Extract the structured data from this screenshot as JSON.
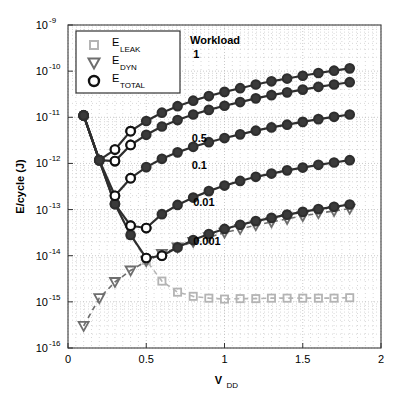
{
  "chart_data": {
    "type": "line",
    "title": "",
    "xlabel": "V_DD",
    "xlabel_base": "V",
    "xlabel_sub": "DD",
    "ylabel": "E/cycle (J)",
    "xlim": [
      0,
      2
    ],
    "ylim_exp": [
      -16,
      -9
    ],
    "xticks": [
      0,
      0.5,
      1,
      1.5,
      2
    ],
    "xticklabels": [
      "0",
      "0.5",
      "1",
      "1.5",
      "2"
    ],
    "yticks_exp": [
      -9,
      -10,
      -11,
      -12,
      -13,
      -14,
      -15,
      -16
    ],
    "yticklabels": [
      "10",
      "10",
      "10",
      "10",
      "10",
      "10",
      "10",
      "10"
    ],
    "ytick_exponents": [
      "-9",
      "-10",
      "-11",
      "-12",
      "-13",
      "-14",
      "-15",
      "-16"
    ],
    "grid": "minor-dotted-both-axes",
    "legend_position": "top-left-inside",
    "legend": [
      {
        "label": "E",
        "sub": "LEAK",
        "marker": "square",
        "color": "#b4b4b4"
      },
      {
        "label": "E",
        "sub": "DYN",
        "marker": "triangle-down",
        "color": "#6e6e6e"
      },
      {
        "label": "E",
        "sub": "TOTAL",
        "marker": "circle",
        "color": "#111111"
      }
    ],
    "annotations": [
      {
        "text": "Workload",
        "x": 0.78,
        "y_exp": -9.42
      },
      {
        "text": "1",
        "x": 0.8,
        "y_exp": -9.72
      },
      {
        "text": "0.5",
        "x": 0.79,
        "y_exp": -11.53
      },
      {
        "text": "0.1",
        "x": 0.79,
        "y_exp": -12.12
      },
      {
        "text": "0.01",
        "x": 0.8,
        "y_exp": -12.93
      },
      {
        "text": "0.001",
        "x": 0.8,
        "y_exp": -13.76
      }
    ],
    "x": [
      0.1,
      0.2,
      0.3,
      0.4,
      0.5,
      0.6,
      0.7,
      0.8,
      0.9,
      1.0,
      1.1,
      1.2,
      1.3,
      1.4,
      1.5,
      1.6,
      1.7,
      1.8
    ],
    "series": [
      {
        "name": "E_LEAK",
        "marker": "square",
        "color": "#b4b4b4",
        "linestyle": "dashed",
        "log_values": [
          -10.96,
          -11.93,
          -12.88,
          -13.55,
          -14.1,
          -14.55,
          -14.79,
          -14.88,
          -14.92,
          -14.94,
          -14.93,
          -14.93,
          -14.92,
          -14.92,
          -14.92,
          -14.92,
          -14.92,
          -14.91
        ]
      },
      {
        "name": "E_DYN",
        "marker": "triangle-down",
        "color": "#6e6e6e",
        "linestyle": "dashed",
        "log_values": [
          -15.52,
          -14.92,
          -14.57,
          -14.32,
          -14.12,
          -13.96,
          -13.82,
          -13.7,
          -13.6,
          -13.5,
          -13.42,
          -13.34,
          -13.27,
          -13.2,
          -13.14,
          -13.08,
          -13.03,
          -12.98
        ]
      },
      {
        "name": "E_TOTAL_w1",
        "marker": "circle",
        "color": "#2e2e2e",
        "linestyle": "solid",
        "workload": 1,
        "log_values": [
          -10.96,
          -11.93,
          -11.7,
          -11.3,
          -11.08,
          -10.9,
          -10.76,
          -10.64,
          -10.54,
          -10.45,
          -10.37,
          -10.29,
          -10.22,
          -10.16,
          -10.1,
          -10.04,
          -9.99,
          -9.94
        ]
      },
      {
        "name": "E_TOTAL_w05",
        "marker": "circle",
        "color": "#2e2e2e",
        "linestyle": "solid",
        "workload": 0.5,
        "log_values": [
          -10.96,
          -11.93,
          -11.95,
          -11.6,
          -11.38,
          -11.2,
          -11.06,
          -10.94,
          -10.84,
          -10.75,
          -10.67,
          -10.59,
          -10.52,
          -10.46,
          -10.4,
          -10.34,
          -10.29,
          -10.24
        ]
      },
      {
        "name": "E_TOTAL_w01",
        "marker": "circle",
        "color": "#2e2e2e",
        "linestyle": "solid",
        "workload": 0.1,
        "log_values": [
          -10.96,
          -11.93,
          -12.7,
          -12.32,
          -12.08,
          -11.9,
          -11.76,
          -11.64,
          -11.54,
          -11.45,
          -11.37,
          -11.29,
          -11.22,
          -11.16,
          -11.1,
          -11.04,
          -10.99,
          -10.94
        ]
      },
      {
        "name": "E_TOTAL_w001",
        "marker": "circle",
        "color": "#2e2e2e",
        "linestyle": "solid",
        "workload": 0.01,
        "log_values": [
          -10.96,
          -11.93,
          -12.88,
          -13.35,
          -13.4,
          -13.1,
          -12.9,
          -12.74,
          -12.6,
          -12.48,
          -12.38,
          -12.29,
          -12.22,
          -12.15,
          -12.09,
          -12.03,
          -11.98,
          -11.93
        ]
      },
      {
        "name": "E_TOTAL_w0001",
        "marker": "circle",
        "color": "#2e2e2e",
        "linestyle": "solid",
        "workload": 0.001,
        "log_values": [
          -10.96,
          -11.93,
          -12.88,
          -13.55,
          -14.05,
          -14.0,
          -13.82,
          -13.66,
          -13.53,
          -13.42,
          -13.33,
          -13.25,
          -13.18,
          -13.11,
          -13.05,
          -12.99,
          -12.94,
          -12.89
        ]
      }
    ]
  }
}
